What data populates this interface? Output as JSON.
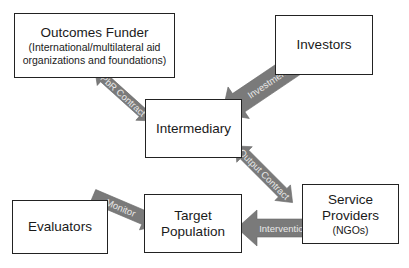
{
  "diagram": {
    "nodes": {
      "outcomes_funder": {
        "title": "Outcomes Funder",
        "subtitle": "(International/multilateral aid organizations and foundations)",
        "subtitle_line1": "(International/multilateral aid",
        "subtitle_line2": "organizations and foundations)"
      },
      "investors": {
        "title": "Investors"
      },
      "intermediary": {
        "title": "Intermediary"
      },
      "evaluators": {
        "title": "Evaluators"
      },
      "target_population": {
        "title_line1": "Target",
        "title_line2": "Population"
      },
      "service_providers": {
        "title_line1": "Service",
        "title_line2": "Providers",
        "subtitle": "(NGOs)"
      }
    },
    "edges": [
      {
        "label": "PbR Contract",
        "from": "Outcomes Funder",
        "to": "Intermediary",
        "direction": "both"
      },
      {
        "label": "Investment",
        "from": "Investors",
        "to": "Intermediary",
        "direction": "forward"
      },
      {
        "label": "Output Contract",
        "from": "Intermediary",
        "to": "Service Providers",
        "direction": "both"
      },
      {
        "label": "Monitor",
        "from": "Evaluators",
        "to": "Target Population",
        "direction": "forward"
      },
      {
        "label": "Intervention",
        "from": "Service Providers",
        "to": "Target Population",
        "direction": "forward"
      }
    ],
    "colors": {
      "arrow_fill": "#7a7a7a",
      "arrow_text": "#e8e8e8",
      "box_border": "#222222"
    }
  }
}
